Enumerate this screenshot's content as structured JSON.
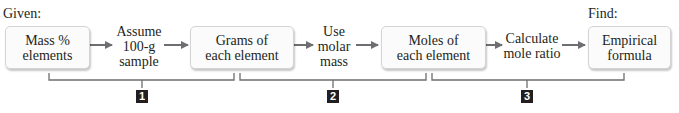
{
  "given_label": "Given:",
  "find_label": "Find:",
  "boxes": [
    {
      "line1": "Mass %",
      "line2": "elements"
    },
    {
      "line1": "Grams of",
      "line2": "each element"
    },
    {
      "line1": "Moles of",
      "line2": "each element"
    },
    {
      "line1": "Empirical",
      "line2": "formula"
    }
  ],
  "steps": [
    {
      "line1": "Assume",
      "line2": "100-g",
      "line3": "sample"
    },
    {
      "line1": "Use",
      "line2": "molar",
      "line3": "mass"
    },
    {
      "line1": "Calculate",
      "line2": "mole ratio"
    }
  ],
  "stage_badges": [
    "1",
    "2",
    "3"
  ],
  "colors": {
    "arrow": "#6d6e71",
    "bracket": "#6d6e71",
    "badge": "#231f20"
  }
}
